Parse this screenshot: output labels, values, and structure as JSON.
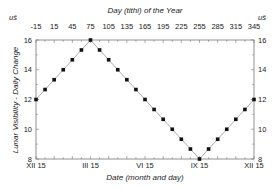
{
  "chart_data": {
    "type": "line",
    "title": "",
    "xlabel": "Date (month and day)",
    "x2label": "Day (tithi) of the Year",
    "ylabel": "Lunar Visibility - Daily Change",
    "unit_left": "uš",
    "unit_right": "uš",
    "xlim": [
      -15,
      345
    ],
    "ylim": [
      8,
      16
    ],
    "top_ticks": [
      "-15",
      "15",
      "45",
      "75",
      "105",
      "135",
      "165",
      "195",
      "225",
      "255",
      "285",
      "315",
      "345"
    ],
    "bottom_ticks": [
      {
        "label": "XII 15",
        "x": -15
      },
      {
        "label": "III 15",
        "x": 75
      },
      {
        "label": "VI 15",
        "x": 165
      },
      {
        "label": "IX 15",
        "x": 255
      },
      {
        "label": "XII 15",
        "x": 345
      }
    ],
    "y_ticks": [
      "8",
      "10",
      "12",
      "14",
      "16"
    ],
    "grid": false,
    "legend": null,
    "series": [
      {
        "name": "Lunar visibility daily change",
        "x": [
          -15,
          0,
          15,
          30,
          45,
          60,
          75,
          90,
          105,
          120,
          135,
          150,
          165,
          180,
          195,
          210,
          225,
          240,
          255,
          270,
          285,
          300,
          315,
          330,
          345
        ],
        "y": [
          12,
          12.67,
          13.33,
          14,
          14.67,
          15.33,
          16,
          15.33,
          14.67,
          14,
          13.33,
          12.67,
          12,
          11.33,
          10.67,
          10,
          9.33,
          8.67,
          8,
          8.67,
          9.33,
          10,
          10.67,
          11.33,
          12
        ]
      }
    ]
  }
}
